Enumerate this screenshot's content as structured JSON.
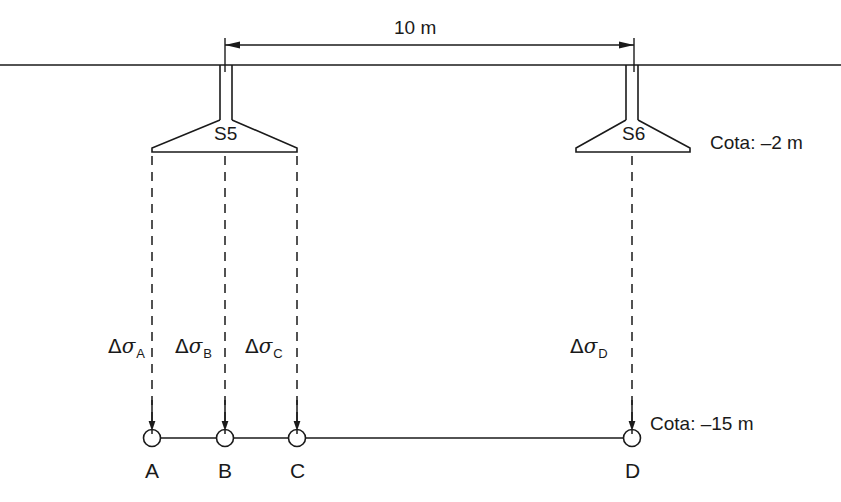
{
  "figure": {
    "type": "engineering-section-diagram",
    "ink_color": "#1a1a1a",
    "background_color": "#ffffff"
  },
  "dimension": {
    "label": "10 m",
    "from_footing": "S5",
    "to_footing": "S6"
  },
  "levels": {
    "ground_label": "",
    "footing_level": "Cota: –2 m",
    "analysis_level": "Cota: –15 m"
  },
  "footings": [
    {
      "id": "S5",
      "label": "S5"
    },
    {
      "id": "S6",
      "label": "S6"
    }
  ],
  "stresses": [
    {
      "id": "A",
      "delta": "Δ",
      "sigma": "σ",
      "subscript": "A"
    },
    {
      "id": "B",
      "delta": "Δ",
      "sigma": "σ",
      "subscript": "B"
    },
    {
      "id": "C",
      "delta": "Δ",
      "sigma": "σ",
      "subscript": "C"
    },
    {
      "id": "D",
      "delta": "Δ",
      "sigma": "σ",
      "subscript": "D"
    }
  ],
  "points": [
    {
      "id": "A",
      "label": "A"
    },
    {
      "id": "B",
      "label": "B"
    },
    {
      "id": "C",
      "label": "C"
    },
    {
      "id": "D",
      "label": "D"
    }
  ]
}
